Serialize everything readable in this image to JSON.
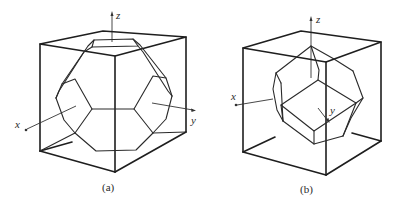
{
  "figures": [
    {
      "id": "a",
      "caption": "(a)",
      "description": "Truncated octahedron inscribed in a cube",
      "axes": {
        "x": "x",
        "y": "y",
        "z": "z"
      }
    },
    {
      "id": "b",
      "caption": "(b)",
      "description": "Rhombic dodecahedron inscribed in a cube",
      "axes": {
        "x": "x",
        "y": "y",
        "z": "z"
      }
    }
  ],
  "colors": {
    "line": "#1e1e1e",
    "background": "#ffffff"
  }
}
